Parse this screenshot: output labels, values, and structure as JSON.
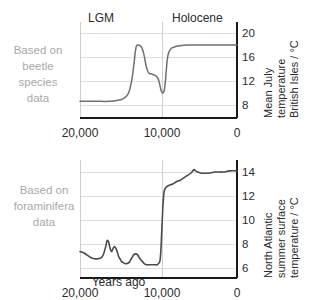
{
  "figure": {
    "xlabel": "Years ago",
    "panels": [
      "beetle",
      "foraminifera"
    ]
  },
  "chart_data": [
    {
      "type": "line",
      "id": "beetle-panel",
      "title": "",
      "xlabel": "Years ago",
      "ylabel": "Mean July temperature British Isles / °C",
      "ylabel_lines": [
        "Mean July",
        "temperature",
        "British Isles / °C"
      ],
      "annotation": "Based on beetle species data",
      "annotation_lines": [
        "Based on",
        "beetle",
        "species",
        "data"
      ],
      "period_labels": [
        {
          "text": "LGM",
          "x": 18000
        },
        {
          "text": "Holocene",
          "x": 7000
        }
      ],
      "period_divider_x": 11500,
      "xlim": [
        22000,
        0
      ],
      "ylim": [
        6,
        21
      ],
      "xticks": [
        20000,
        10000,
        0
      ],
      "xticklabels": [
        "20,000",
        "10,000",
        "0"
      ],
      "yticks": [
        8,
        12,
        16,
        20
      ],
      "yticklabels": [
        "8",
        "12",
        "16",
        "20"
      ],
      "grid": "horizontal",
      "legend": "none",
      "series": [
        {
          "name": "Mean July temperature, British Isles",
          "units": "°C",
          "x": [
            22000,
            21000,
            20000,
            19000,
            18000,
            17000,
            16500,
            16000,
            15500,
            15200,
            15000,
            14800,
            14600,
            14400,
            14300,
            14200,
            14100,
            14000,
            13800,
            13600,
            13400,
            13200,
            13000,
            12900,
            12800,
            12700,
            12600,
            12500,
            12400,
            12300,
            12200,
            12000,
            11800,
            11600,
            11400,
            11200,
            11000,
            10900,
            10800,
            10700,
            10600,
            10500,
            10400,
            10300,
            10200,
            10100,
            10000,
            9900,
            9800,
            9700,
            9600,
            9400,
            9200,
            9000,
            8500,
            8000,
            7000,
            6000,
            5000,
            4000,
            3000,
            2000,
            1000,
            0
          ],
          "y": [
            8.6,
            8.6,
            8.6,
            8.6,
            8.6,
            8.7,
            8.8,
            9.0,
            9.4,
            9.9,
            10.6,
            11.6,
            13.0,
            14.8,
            15.9,
            16.7,
            17.2,
            17.4,
            17.4,
            17.3,
            17.1,
            16.6,
            15.7,
            15.1,
            14.5,
            14.0,
            13.6,
            13.3,
            13.1,
            13.0,
            12.9,
            12.9,
            12.8,
            12.7,
            12.6,
            12.4,
            12.0,
            11.6,
            11.1,
            10.6,
            10.2,
            10.0,
            9.9,
            10.0,
            10.3,
            11.0,
            12.2,
            13.6,
            14.8,
            15.6,
            16.1,
            16.6,
            16.9,
            17.0,
            17.2,
            17.3,
            17.4,
            17.4,
            17.4,
            17.4,
            17.4,
            17.4,
            17.4,
            17.4
          ]
        }
      ]
    },
    {
      "type": "line",
      "id": "foraminifera-panel",
      "title": "",
      "xlabel": "Years ago",
      "ylabel": "North Atlantic summer surface temperature / °C",
      "ylabel_lines": [
        "North Atlantic",
        "summer surface",
        "temperature / °C"
      ],
      "annotation": "Based on foraminifera data",
      "annotation_lines": [
        "Based on",
        "foraminifera",
        "data"
      ],
      "xlim": [
        22000,
        0
      ],
      "ylim": [
        5.2,
        15
      ],
      "xticks": [
        20000,
        10000,
        0
      ],
      "xticklabels": [
        "20,000",
        "10,000",
        "0"
      ],
      "yticks": [
        6,
        8,
        10,
        12,
        14
      ],
      "yticklabels": [
        "6",
        "8",
        "10",
        "12",
        "14"
      ],
      "grid": "horizontal",
      "legend": "none",
      "series": [
        {
          "name": "North Atlantic summer surface temperature",
          "units": "°C",
          "x": [
            22000,
            21500,
            21000,
            20500,
            20000,
            19500,
            19000,
            18700,
            18400,
            18200,
            18000,
            17800,
            17600,
            17400,
            17200,
            17000,
            16800,
            16600,
            16400,
            16200,
            16000,
            15700,
            15400,
            15100,
            14800,
            14500,
            14200,
            13900,
            13600,
            13300,
            13000,
            12700,
            12400,
            12100,
            11800,
            11500,
            11200,
            11000,
            10800,
            10700,
            10600,
            10500,
            10400,
            10300,
            10200,
            10100,
            10000,
            9800,
            9500,
            9000,
            8500,
            8000,
            7500,
            7000,
            6500,
            6200,
            6000,
            5800,
            5500,
            5000,
            4500,
            4000,
            3000,
            2000,
            1000,
            0
          ],
          "y": [
            7.4,
            7.3,
            7.1,
            6.9,
            6.8,
            6.8,
            6.9,
            7.2,
            7.8,
            8.3,
            8.2,
            7.7,
            7.4,
            7.6,
            7.8,
            7.7,
            7.4,
            7.0,
            6.8,
            6.6,
            6.5,
            6.4,
            6.4,
            6.5,
            6.8,
            7.1,
            7.2,
            7.1,
            6.8,
            6.6,
            6.4,
            6.3,
            6.3,
            6.3,
            6.3,
            6.3,
            6.3,
            6.4,
            6.6,
            7.2,
            8.3,
            9.7,
            11.0,
            11.9,
            12.4,
            12.6,
            12.7,
            12.8,
            12.9,
            13.0,
            13.2,
            13.3,
            13.5,
            13.7,
            13.9,
            14.1,
            14.2,
            14.1,
            14.0,
            13.9,
            13.9,
            13.9,
            14.0,
            14.0,
            14.1,
            14.1
          ]
        }
      ]
    }
  ]
}
